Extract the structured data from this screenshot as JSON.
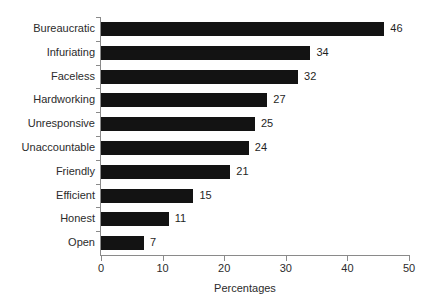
{
  "chart_data": {
    "type": "bar",
    "orientation": "horizontal",
    "title": "",
    "xlabel": "Percentages",
    "ylabel": "",
    "categories": [
      "Bureaucratic",
      "Infuriating",
      "Faceless",
      "Hardworking",
      "Unresponsive",
      "Unaccountable",
      "Friendly",
      "Efficient",
      "Honest",
      "Open"
    ],
    "values": [
      46,
      34,
      32,
      27,
      25,
      24,
      21,
      15,
      11,
      7
    ],
    "value_labels": [
      "46",
      "34",
      "32",
      "27",
      "25",
      "24",
      "21",
      "15",
      "11",
      "7"
    ],
    "xlim": [
      0,
      50
    ],
    "xticks": [
      0,
      10,
      20,
      30,
      40,
      50
    ],
    "xtick_labels": [
      "0",
      "10",
      "20",
      "30",
      "40",
      "50"
    ],
    "grid": false,
    "legend": null,
    "bar_color": "#131313",
    "axis_color": "#8a8a8a",
    "text_color": "#2b2b2b",
    "background_color": "#ffffff"
  }
}
